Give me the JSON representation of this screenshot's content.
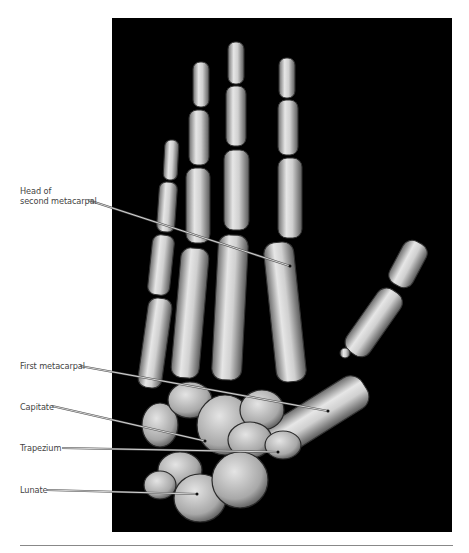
{
  "figure": {
    "background_color": "#000000",
    "labels": [
      {
        "id": "head-second-metacarpal",
        "lines": [
          "Head of",
          "second metacarpal"
        ],
        "text_x": 20,
        "text_y": 186,
        "line": [
          88,
          200,
          290,
          266
        ]
      },
      {
        "id": "first-metacarpal",
        "lines": [
          "First metacarpal"
        ],
        "text_x": 20,
        "text_y": 361,
        "line": [
          80,
          366,
          328,
          411
        ]
      },
      {
        "id": "capitate",
        "lines": [
          "Capitate"
        ],
        "text_x": 20,
        "text_y": 402,
        "line": [
          52,
          406,
          205,
          441
        ]
      },
      {
        "id": "trapezium",
        "lines": [
          "Trapezium"
        ],
        "text_x": 20,
        "text_y": 443,
        "line": [
          62,
          448,
          278,
          452
        ]
      },
      {
        "id": "lunate",
        "lines": [
          "Lunate"
        ],
        "text_x": 20,
        "text_y": 485,
        "line": [
          47,
          490,
          197,
          494
        ]
      }
    ]
  }
}
